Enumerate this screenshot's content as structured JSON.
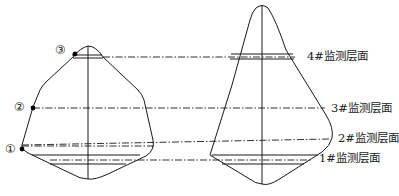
{
  "diagram": {
    "type": "cross-section",
    "left_section": {
      "points": [
        {
          "id": "p3",
          "label": "③"
        },
        {
          "id": "p2",
          "label": "②"
        },
        {
          "id": "p1",
          "label": "①"
        }
      ]
    },
    "right_section": {
      "layers": [
        {
          "id": "layer4",
          "label": "4#监测层面"
        },
        {
          "id": "layer3",
          "label": "3#监测层面"
        },
        {
          "id": "layer2",
          "label": "2#监测层面"
        },
        {
          "id": "layer1",
          "label": "1#监测层面"
        }
      ]
    },
    "colors": {
      "stroke": "#1a1a1a",
      "background": "#ffffff"
    }
  }
}
